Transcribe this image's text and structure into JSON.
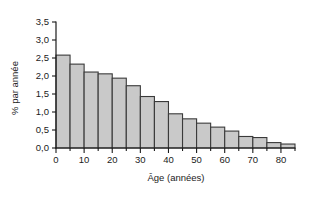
{
  "chart_data": {
    "type": "bar",
    "title": "",
    "subtitle": "",
    "xlabel": "Âge (années)",
    "ylabel": "% par année",
    "xlim": [
      0,
      85
    ],
    "ylim": [
      0.0,
      3.5
    ],
    "grid": false,
    "legend": null,
    "bin_width": 5,
    "x_tick_labels": [
      "0",
      "10",
      "20",
      "30",
      "40",
      "50",
      "60",
      "70",
      "80"
    ],
    "x_tick_values": [
      0,
      10,
      20,
      30,
      40,
      50,
      60,
      70,
      80
    ],
    "x_minor_tick_values": [
      5,
      15,
      25,
      35,
      45,
      55,
      65,
      75,
      85
    ],
    "y_tick_labels": [
      "0,0",
      "0,5",
      "1,0",
      "1,5",
      "2,0",
      "2,5",
      "3,0",
      "3,5"
    ],
    "y_tick_values": [
      0.0,
      0.5,
      1.0,
      1.5,
      2.0,
      2.5,
      3.0,
      3.5
    ],
    "categories": [
      "0-5",
      "5-10",
      "10-15",
      "15-20",
      "20-25",
      "25-30",
      "30-35",
      "35-40",
      "40-45",
      "45-50",
      "50-55",
      "55-60",
      "60-65",
      "65-70",
      "70-75",
      "75-80",
      "80-85"
    ],
    "bin_starts": [
      0,
      5,
      10,
      15,
      20,
      25,
      30,
      35,
      40,
      45,
      50,
      55,
      60,
      65,
      70,
      75,
      80
    ],
    "values": [
      2.58,
      2.33,
      2.11,
      2.06,
      1.94,
      1.73,
      1.43,
      1.29,
      0.95,
      0.81,
      0.69,
      0.58,
      0.47,
      0.32,
      0.29,
      0.15,
      0.11
    ],
    "bar_fill_color": "#c9c9c9",
    "bar_edge_color": "#3a3a3a",
    "axis_color": "#1b1b1b",
    "background_color": "#ffffff"
  }
}
